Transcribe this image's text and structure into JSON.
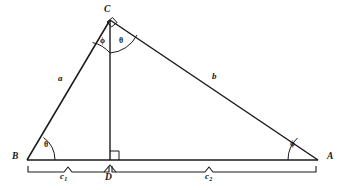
{
  "figure": {
    "type": "geometry-diagram",
    "stroke_color": "#1a1a1a",
    "background_color": "#ffffff",
    "vertices": [
      {
        "name": "C",
        "label": "C",
        "x": 110,
        "y": 20,
        "label_x": 104,
        "label_y": 8
      },
      {
        "name": "B",
        "label": "B",
        "x": 27,
        "y": 160,
        "label_x": 12,
        "label_y": 155
      },
      {
        "name": "A",
        "label": "A",
        "x": 318,
        "y": 160,
        "label_x": 327,
        "label_y": 155
      },
      {
        "name": "D",
        "label": "D",
        "x": 110,
        "y": 160,
        "label_x": 106,
        "label_y": 176
      }
    ],
    "sides": [
      {
        "name": "a",
        "label": "a",
        "from": "B",
        "to": "C",
        "label_x": 58,
        "label_y": 78
      },
      {
        "name": "b",
        "label": "b",
        "from": "C",
        "to": "A",
        "label_x": 212,
        "label_y": 76
      }
    ],
    "angles": [
      {
        "name": "angle-at-B",
        "label": "θ",
        "vertex": "B",
        "label_x": 44,
        "label_y": 145
      },
      {
        "name": "angle-at-A",
        "label": "ϕ",
        "vertex": "A",
        "label_x": 290,
        "label_y": 144
      },
      {
        "name": "angle-C-left",
        "label": "ϕ",
        "vertex": "C",
        "label_x": 100,
        "label_y": 41
      },
      {
        "name": "angle-C-right",
        "label": "θ",
        "vertex": "C",
        "label_x": 119,
        "label_y": 41
      }
    ],
    "right_angles": [
      {
        "name": "right-angle-at-D",
        "at_x": 110,
        "at_y": 160
      },
      {
        "name": "right-angle-at-C",
        "at_x": 110,
        "at_y": 20
      }
    ],
    "braces": [
      {
        "name": "brace-c1",
        "label": "c",
        "subscript": "1",
        "from_x": 27,
        "to_x": 110,
        "label_x": 62,
        "label_y": 175
      },
      {
        "name": "brace-c2",
        "label": "c",
        "subscript": "2",
        "from_x": 110,
        "to_x": 318,
        "label_x": 208,
        "label_y": 175
      }
    ]
  }
}
